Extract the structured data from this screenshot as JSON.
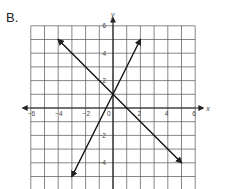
{
  "label": "B.",
  "chart_data": {
    "type": "line",
    "title": "",
    "xlabel": "x",
    "ylabel": "y",
    "xlim": [
      -6,
      6
    ],
    "ylim": [
      -6,
      6
    ],
    "grid": true,
    "x_ticks": [
      -6,
      -4,
      -2,
      0,
      2,
      4,
      6
    ],
    "y_ticks": [
      6,
      4,
      2,
      -2,
      -4,
      -6
    ],
    "x_tick_labels": [
      "−6",
      "−4",
      "−2",
      "0",
      "2",
      "4",
      "6"
    ],
    "y_tick_labels": [
      "6",
      "4",
      "2",
      "−2",
      "−4",
      "−6"
    ],
    "series": [
      {
        "name": "line-decreasing",
        "equation": "y = -x + 1",
        "x": [
          -4,
          5
        ],
        "y": [
          5,
          -4
        ],
        "arrows": "both"
      },
      {
        "name": "line-increasing",
        "equation": "y = 2x + 1",
        "x": [
          -3,
          2
        ],
        "y": [
          -5,
          5
        ],
        "arrows": "both"
      }
    ],
    "intersection": [
      0,
      1
    ]
  }
}
